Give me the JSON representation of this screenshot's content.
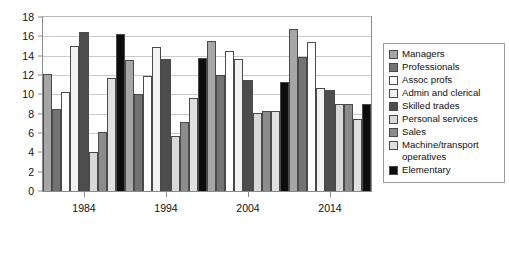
{
  "chart_data": {
    "type": "bar",
    "title": "",
    "subtitle": "",
    "xlabel": "",
    "ylabel": "",
    "categories": [
      "1984",
      "1994",
      "2004",
      "2014"
    ],
    "ylim": [
      0,
      18
    ],
    "ytick_labels": [
      "0",
      "2",
      "4",
      "6",
      "8",
      "10",
      "12",
      "14",
      "16",
      "18"
    ],
    "ytick_values": [
      0,
      2,
      4,
      6,
      8,
      10,
      12,
      14,
      16,
      18
    ],
    "grid": true,
    "legend_position": "right",
    "series": [
      {
        "name": "Managers",
        "color": "#a6a6a6",
        "values": [
          12.1,
          13.6,
          15.5,
          16.8
        ]
      },
      {
        "name": "Professionals",
        "color": "#737373",
        "values": [
          8.5,
          10.0,
          12.0,
          13.9
        ]
      },
      {
        "name": "Assoc profs",
        "color": "#ffffff",
        "values": [
          10.2,
          11.9,
          14.5,
          15.4
        ]
      },
      {
        "name": "Admin and clerical",
        "color": "#f2f2f2",
        "values": [
          15.0,
          14.9,
          13.7,
          10.7
        ]
      },
      {
        "name": "Skilled trades",
        "color": "#4d4d4d",
        "values": [
          16.4,
          13.7,
          11.5,
          10.5
        ]
      },
      {
        "name": "Personal services",
        "color": "#d9d9d9",
        "values": [
          4.0,
          5.7,
          8.1,
          9.0
        ]
      },
      {
        "name": "Sales",
        "color": "#8c8c8c",
        "values": [
          6.1,
          7.1,
          8.3,
          9.0
        ]
      },
      {
        "name": "Machine/transport\noperatives",
        "color": "#e0e0e0",
        "values": [
          11.7,
          9.6,
          8.3,
          7.4
        ]
      },
      {
        "name": "Elementary",
        "color": "#0d0d0d",
        "values": [
          16.2,
          13.8,
          11.3,
          9.0
        ]
      }
    ]
  }
}
